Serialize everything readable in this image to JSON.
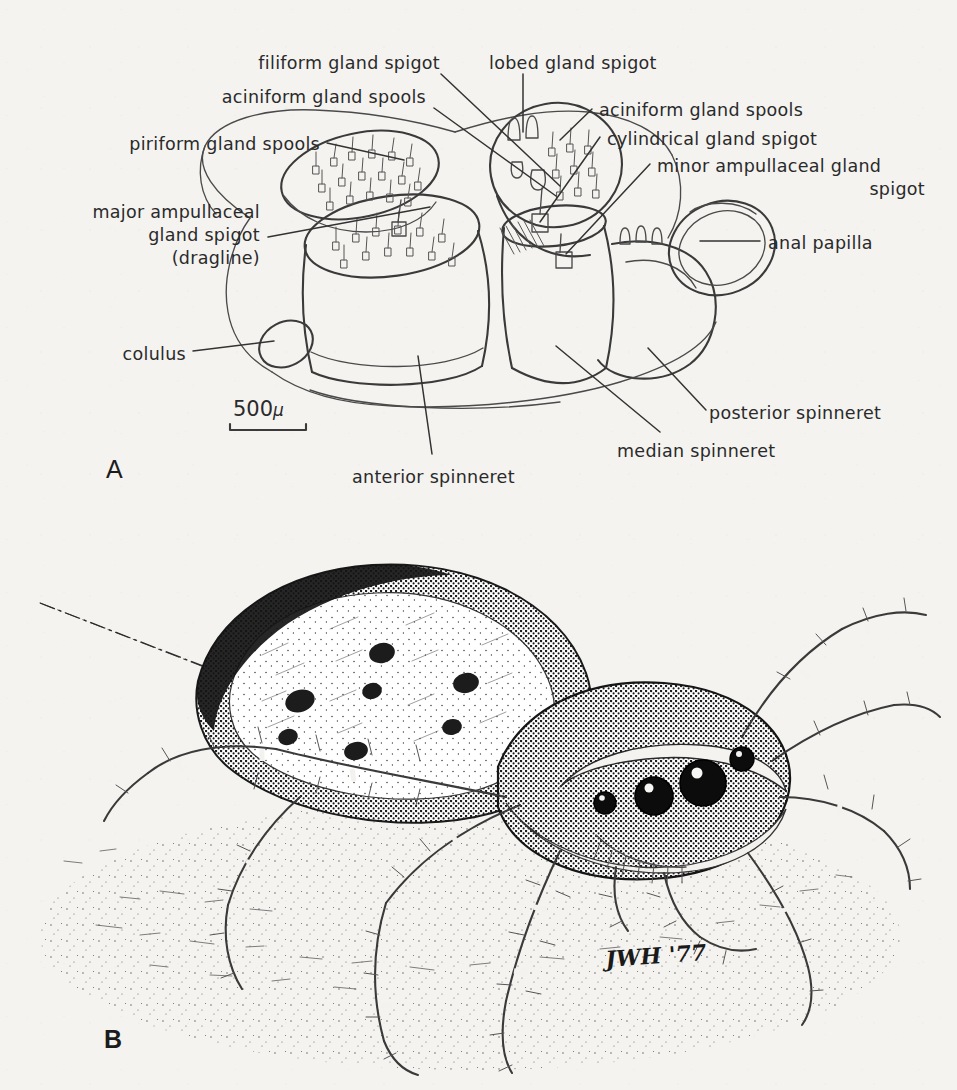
{
  "figure": {
    "background_color": "#f4f3f0",
    "ink_color": "#3a3a3a",
    "panels": [
      {
        "id": "A",
        "letter": "A",
        "caption_role": "spinneret-field-diagram"
      },
      {
        "id": "B",
        "letter": "B",
        "caption_role": "habitus-drawing"
      }
    ]
  },
  "panel_a": {
    "letter": "A",
    "scale_bar": {
      "value": "500",
      "unit": "μ",
      "label": "500 μ"
    },
    "labels": [
      {
        "id": "filiform",
        "text": "filiform gland spigot"
      },
      {
        "id": "aciniform_left",
        "text": "aciniform gland spools"
      },
      {
        "id": "piriform",
        "text": "piriform gland spools"
      },
      {
        "id": "major_ampullaceal_l1",
        "text": "major ampullaceal"
      },
      {
        "id": "major_ampullaceal_l2",
        "text": "gland spigot"
      },
      {
        "id": "major_ampullaceal_l3",
        "text": "(dragline)"
      },
      {
        "id": "colulus",
        "text": "colulus"
      },
      {
        "id": "lobed",
        "text": "lobed gland spigot"
      },
      {
        "id": "aciniform_right",
        "text": "aciniform gland spools"
      },
      {
        "id": "cylindrical",
        "text": "cylindrical gland spigot"
      },
      {
        "id": "minor_ampullaceal_l1",
        "text": "minor ampullaceal gland"
      },
      {
        "id": "minor_ampullaceal_l2",
        "text": "spigot"
      },
      {
        "id": "anal_papilla",
        "text": "anal papilla"
      },
      {
        "id": "posterior_spinneret",
        "text": "posterior spinneret"
      },
      {
        "id": "median_spinneret",
        "text": "median spinneret"
      },
      {
        "id": "anterior_spinneret",
        "text": "anterior spinneret"
      }
    ]
  },
  "panel_b": {
    "letter": "B",
    "signature": "JWH '77",
    "subject": "jumping spider on substrate with dragline silk"
  }
}
